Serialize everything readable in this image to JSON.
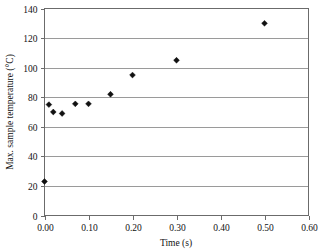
{
  "chart_data": {
    "type": "scatter",
    "title": "",
    "xlabel": "Time (s)",
    "ylabel": "Max. sample temperature (°C)",
    "xlim": [
      0.0,
      0.6
    ],
    "ylim": [
      0,
      140
    ],
    "xticks": [
      0.0,
      0.1,
      0.2,
      0.3,
      0.4,
      0.5,
      0.6
    ],
    "xtick_labels": [
      "0.00",
      "0.10",
      "0.20",
      "0.30",
      "0.40",
      "0.50",
      "0.60"
    ],
    "yticks": [
      0,
      20,
      40,
      60,
      80,
      100,
      120,
      140
    ],
    "ytick_labels": [
      "0",
      "20",
      "40",
      "60",
      "80",
      "100",
      "120",
      "140"
    ],
    "grid": "horizontal",
    "legend": "none",
    "marker_style": "filled-diamond",
    "marker_color": "#111111",
    "x": [
      0.0,
      0.01,
      0.02,
      0.04,
      0.07,
      0.1,
      0.15,
      0.2,
      0.3,
      0.5
    ],
    "y": [
      23,
      75,
      70,
      69,
      75.5,
      75.5,
      82,
      95,
      105,
      130
    ],
    "points": [
      {
        "x": 0.0,
        "y": 23
      },
      {
        "x": 0.01,
        "y": 75
      },
      {
        "x": 0.02,
        "y": 70
      },
      {
        "x": 0.04,
        "y": 69
      },
      {
        "x": 0.07,
        "y": 75.5
      },
      {
        "x": 0.1,
        "y": 75.5
      },
      {
        "x": 0.15,
        "y": 82
      },
      {
        "x": 0.2,
        "y": 95
      },
      {
        "x": 0.3,
        "y": 105
      },
      {
        "x": 0.5,
        "y": 130
      }
    ]
  },
  "axes": {
    "x_title": "Time (s)",
    "y_title": "Max. sample temperature (°C)"
  }
}
